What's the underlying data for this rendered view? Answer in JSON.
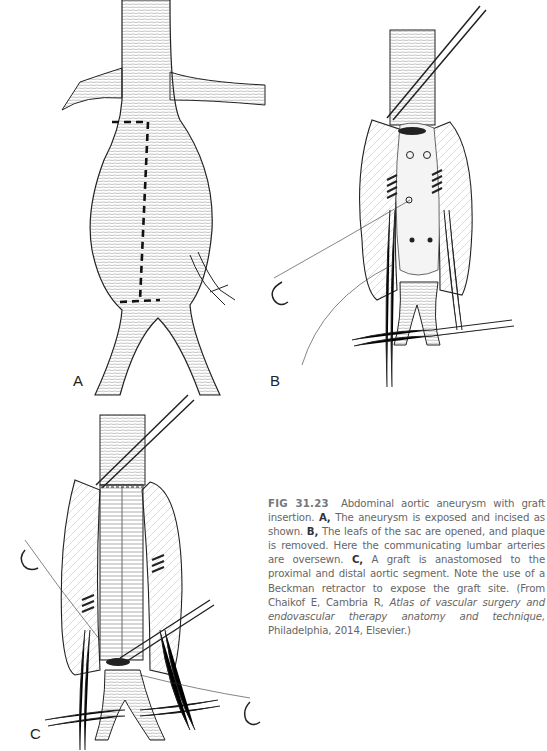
{
  "figure": {
    "panels": [
      {
        "id": "A",
        "label": "A"
      },
      {
        "id": "B",
        "label": "B"
      },
      {
        "id": "C",
        "label": "C"
      }
    ],
    "caption": {
      "figure_number": "FIG 31.23",
      "intro": "Abdominal aortic aneurysm with graft insertion.",
      "part_a_label": "A,",
      "part_a_text": "The aneurysm is exposed and incised as shown.",
      "part_b_label": "B,",
      "part_b_text": "The leafs of the sac are opened, and plaque is removed. Here the communicating lumbar arteries are oversewn.",
      "part_c_label": "C,",
      "part_c_text": "A graft is anastomosed to the proximal and distal aortic segment. Note the use of a Beckman retractor to expose the graft site.",
      "source_prefix": "(From Chaikof E, Cambria R,",
      "source_title": "Atlas of vascular surgery and endovascular therapy anatomy and technique,",
      "source_suffix": "Philadelphia, 2014, Elsevier.)"
    }
  },
  "colors": {
    "line": "#222222",
    "hatch": "#9a9a9a",
    "caption_text": "#666666",
    "background": "#ffffff"
  }
}
